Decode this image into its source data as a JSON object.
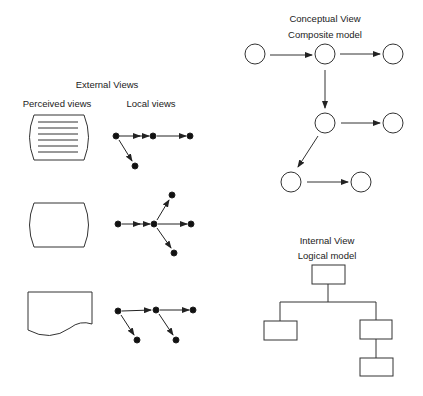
{
  "external": {
    "title": "External Views",
    "perceived_label": "Perceived views",
    "local_label": "Local views"
  },
  "conceptual": {
    "title": "Conceptual View",
    "subtitle": "Composite model"
  },
  "internal": {
    "title": "Internal View",
    "subtitle": "Logical model"
  }
}
